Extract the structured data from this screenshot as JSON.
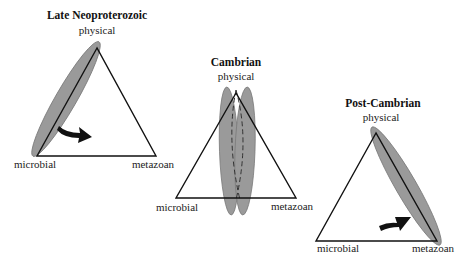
{
  "diagram": {
    "type": "ternary-diagram-series",
    "panels": [
      {
        "title": "Late Neoproterozoic",
        "vertices": {
          "top": "physical",
          "left": "microbial",
          "right": "metazoan"
        },
        "description": "Field elongated along physical–microbial edge; arrow points inward toward metazoan."
      },
      {
        "title": "Cambrian",
        "vertices": {
          "top": "physical",
          "left": "microbial",
          "right": "metazoan"
        },
        "description": "Two overlapping vertical fields (one dashed outline) spanning from physical apex to base center."
      },
      {
        "title": "Post-Cambrian",
        "vertices": {
          "top": "physical",
          "left": "microbial",
          "right": "metazoan"
        },
        "description": "Field elongated along physical–metazoan edge; arrow points toward the field from interior."
      }
    ],
    "colors": {
      "field_fill": "#9a9a9a",
      "lines": "#111111",
      "background": "#ffffff"
    }
  }
}
